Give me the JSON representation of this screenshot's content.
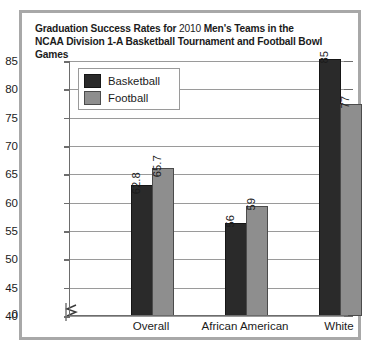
{
  "chart_data": {
    "type": "bar",
    "title_line1_bold_a": "Graduation Success Rates for ",
    "title_line1_light": "2010",
    "title_line1_bold_b": " Men's Teams in the",
    "title_line2": "NCAA Division 1-A Basketball Tournament and Football Bowl Games",
    "title": "Graduation Success Rates for 2010 Men's Teams in the NCAA Division 1-A Basketball Tournament and Football Bowl Games",
    "categories": [
      "Overall",
      "African American",
      "White"
    ],
    "series": [
      {
        "name": "Basketball",
        "color": "#2a2a2a",
        "values": [
          62.8,
          56,
          85
        ],
        "labels": [
          "62.8",
          "56",
          "85"
        ]
      },
      {
        "name": "Football",
        "color": "#8e8e8e",
        "values": [
          65.7,
          59,
          77
        ],
        "labels": [
          "65.7",
          "59",
          "77"
        ]
      }
    ],
    "xlabel": "",
    "ylabel": "",
    "ylim": [
      40,
      85
    ],
    "y_axis_broken": true,
    "y_zero_label": "0",
    "yticks": [
      40,
      45,
      50,
      55,
      60,
      65,
      70,
      75,
      80,
      85
    ],
    "ytick_labels": [
      "40",
      "45",
      "50",
      "55",
      "60",
      "65",
      "70",
      "75",
      "80",
      "85"
    ],
    "grid": true,
    "legend_position": "top-left"
  }
}
